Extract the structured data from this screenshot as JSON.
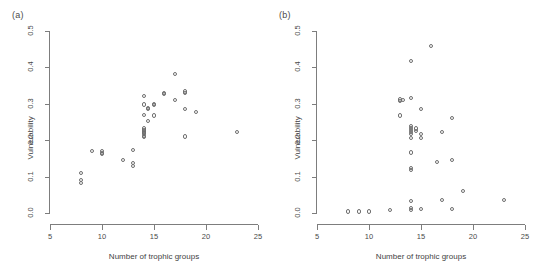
{
  "figure": {
    "background": "#ffffff",
    "point_color": "#6e6e6e",
    "axis_color": "#7d7d7d",
    "text_color": "#4a4a4a"
  },
  "panels": [
    {
      "id": "panel-a",
      "label": "(a)",
      "chart_data": {
        "type": "scatter",
        "title": "",
        "xlabel": "Number of trophic groups",
        "ylabel": "Vulnerability",
        "xlim": [
          5,
          25
        ],
        "ylim": [
          0.0,
          0.5
        ],
        "xticks": [
          5,
          10,
          15,
          20,
          25
        ],
        "xticklabels": [
          "5",
          "10",
          "15",
          "20",
          "25"
        ],
        "yticks": [
          0.0,
          0.1,
          0.2,
          0.3,
          0.4,
          0.5
        ],
        "yticklabels": [
          "0.0",
          "0.1",
          "0.2",
          "0.3",
          "0.4",
          "0.5"
        ],
        "grid": false,
        "legend": null,
        "marker": "open-circle",
        "points": [
          [
            8,
            0.11
          ],
          [
            8,
            0.09
          ],
          [
            8,
            0.082
          ],
          [
            9,
            0.17
          ],
          [
            10,
            0.17
          ],
          [
            10,
            0.165
          ],
          [
            10,
            0.162
          ],
          [
            12,
            0.146
          ],
          [
            13,
            0.174
          ],
          [
            13,
            0.137
          ],
          [
            13,
            0.13
          ],
          [
            14,
            0.322
          ],
          [
            14,
            0.298
          ],
          [
            14,
            0.27
          ],
          [
            14,
            0.232
          ],
          [
            14,
            0.228
          ],
          [
            14,
            0.224
          ],
          [
            14,
            0.22
          ],
          [
            14,
            0.216
          ],
          [
            14,
            0.212
          ],
          [
            14,
            0.208
          ],
          [
            14.4,
            0.288
          ],
          [
            14.4,
            0.286
          ],
          [
            14.4,
            0.252
          ],
          [
            15,
            0.3
          ],
          [
            15,
            0.296
          ],
          [
            15,
            0.268
          ],
          [
            16,
            0.33
          ],
          [
            16,
            0.326
          ],
          [
            17,
            0.382
          ],
          [
            17,
            0.31
          ],
          [
            18,
            0.334
          ],
          [
            18,
            0.33
          ],
          [
            18,
            0.286
          ],
          [
            18,
            0.21
          ],
          [
            19,
            0.278
          ],
          [
            23,
            0.222
          ]
        ]
      }
    },
    {
      "id": "panel-b",
      "label": "(b)",
      "chart_data": {
        "type": "scatter",
        "title": "",
        "xlabel": "Number of trophic groups",
        "ylabel": "Vulnerability",
        "xlim": [
          5,
          25
        ],
        "ylim": [
          0.0,
          0.5
        ],
        "xticks": [
          5,
          10,
          15,
          20,
          25
        ],
        "xticklabels": [
          "5",
          "10",
          "15",
          "20",
          "25"
        ],
        "yticks": [
          0.0,
          0.1,
          0.2,
          0.3,
          0.4,
          0.5
        ],
        "yticklabels": [
          "0.0",
          "0.1",
          "0.2",
          "0.3",
          "0.4",
          "0.5"
        ],
        "grid": false,
        "legend": null,
        "marker": "open-circle",
        "points": [
          [
            8,
            0.004
          ],
          [
            9,
            0.004
          ],
          [
            10,
            0.004
          ],
          [
            12,
            0.008
          ],
          [
            13,
            0.312
          ],
          [
            13,
            0.308
          ],
          [
            13.3,
            0.31
          ],
          [
            13,
            0.268
          ],
          [
            14,
            0.418
          ],
          [
            14,
            0.316
          ],
          [
            14,
            0.24
          ],
          [
            14,
            0.234
          ],
          [
            14,
            0.228
          ],
          [
            14,
            0.222
          ],
          [
            14,
            0.216
          ],
          [
            14,
            0.206
          ],
          [
            14,
            0.166
          ],
          [
            14,
            0.124
          ],
          [
            14,
            0.118
          ],
          [
            14,
            0.034
          ],
          [
            14,
            0.014
          ],
          [
            14,
            0.008
          ],
          [
            14.5,
            0.232
          ],
          [
            14.5,
            0.226
          ],
          [
            15,
            0.286
          ],
          [
            15,
            0.216
          ],
          [
            15,
            0.206
          ],
          [
            15,
            0.012
          ],
          [
            16,
            0.458
          ],
          [
            16.5,
            0.14
          ],
          [
            17,
            0.222
          ],
          [
            17,
            0.036
          ],
          [
            18,
            0.26
          ],
          [
            18,
            0.146
          ],
          [
            18,
            0.01
          ],
          [
            19,
            0.06
          ],
          [
            23,
            0.036
          ]
        ]
      }
    }
  ]
}
